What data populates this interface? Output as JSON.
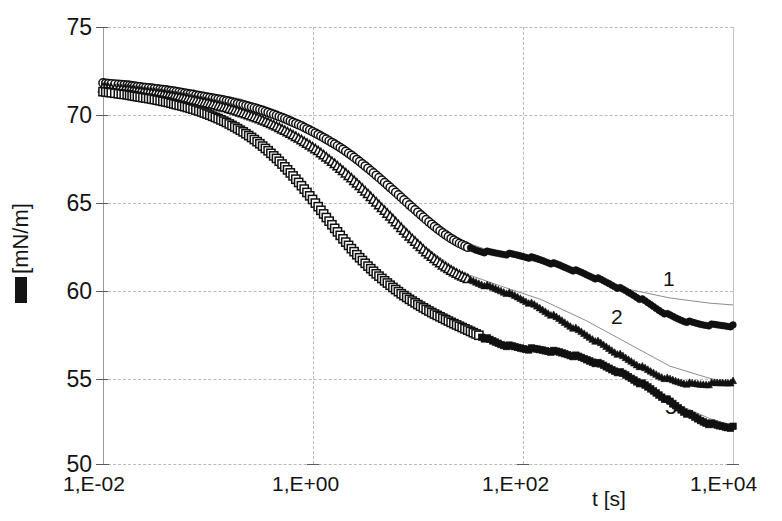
{
  "chart_data": {
    "type": "scatter",
    "title": "",
    "xlabel": "t [s]",
    "ylabel": "[mN/m]",
    "ylabel_symbol": "filled-square-glyph",
    "xscale": "log",
    "xlim": [
      0.01,
      10000
    ],
    "ylim": [
      50,
      75
    ],
    "yticks": [
      50,
      55,
      60,
      65,
      70,
      75
    ],
    "ytick_labels": [
      "50",
      "55",
      "60",
      "65",
      "70",
      "75"
    ],
    "xticks": [
      0.01,
      1,
      100,
      10000
    ],
    "xtick_labels": [
      "1,E-02",
      "1,E+00",
      "1,E+02",
      "1,E+04"
    ],
    "grid": true,
    "legend": "inline-curve-numbers",
    "annotations": [
      {
        "text": "1",
        "x": 2000,
        "y": 61.0
      },
      {
        "text": "2",
        "x": 260,
        "y": 59.6
      },
      {
        "text": "3",
        "x": 700,
        "y": 54.0
      }
    ],
    "series": [
      {
        "name": "1",
        "label": "1",
        "marker_open": "circle",
        "marker_filled": "filled-circle",
        "open_range": [
          0.01,
          30
        ],
        "filled_range": [
          30,
          10000
        ],
        "points": [
          [
            0.01,
            71.8
          ],
          [
            0.012,
            71.75
          ],
          [
            0.014,
            71.72
          ],
          [
            0.017,
            71.68
          ],
          [
            0.02,
            71.62
          ],
          [
            0.024,
            71.55
          ],
          [
            0.029,
            71.5
          ],
          [
            0.035,
            71.44
          ],
          [
            0.042,
            71.38
          ],
          [
            0.05,
            71.3
          ],
          [
            0.06,
            71.22
          ],
          [
            0.072,
            71.14
          ],
          [
            0.087,
            71.05
          ],
          [
            0.104,
            70.96
          ],
          [
            0.125,
            70.88
          ],
          [
            0.15,
            70.78
          ],
          [
            0.18,
            70.66
          ],
          [
            0.216,
            70.55
          ],
          [
            0.26,
            70.42
          ],
          [
            0.312,
            70.28
          ],
          [
            0.374,
            70.12
          ],
          [
            0.449,
            69.94
          ],
          [
            0.539,
            69.76
          ],
          [
            0.646,
            69.55
          ],
          [
            0.776,
            69.34
          ],
          [
            0.931,
            69.1
          ],
          [
            1.12,
            68.85
          ],
          [
            1.34,
            68.58
          ],
          [
            1.61,
            68.3
          ],
          [
            1.93,
            68.0
          ],
          [
            2.32,
            67.66
          ],
          [
            2.78,
            67.3
          ],
          [
            3.34,
            66.92
          ],
          [
            4.0,
            66.52
          ],
          [
            4.81,
            66.1
          ],
          [
            5.77,
            65.68
          ],
          [
            6.92,
            65.25
          ],
          [
            8.3,
            64.82
          ],
          [
            9.97,
            64.4
          ],
          [
            11.96,
            63.98
          ],
          [
            14.36,
            63.58
          ],
          [
            17.23,
            63.22
          ],
          [
            20.68,
            62.9
          ],
          [
            24.81,
            62.62
          ],
          [
            29.77,
            62.4
          ],
          [
            35.73,
            62.24
          ],
          [
            42.87,
            62.14
          ],
          [
            51.45,
            62.08
          ],
          [
            61.74,
            62.04
          ],
          [
            74.08,
            62.0
          ],
          [
            88.9,
            61.94
          ],
          [
            106.7,
            61.86
          ],
          [
            128.0,
            61.76
          ],
          [
            153.6,
            61.64
          ],
          [
            184.3,
            61.5
          ],
          [
            221.2,
            61.36
          ],
          [
            265.4,
            61.2
          ],
          [
            318.5,
            61.04
          ],
          [
            382.2,
            60.88
          ],
          [
            458.6,
            60.7
          ],
          [
            550.3,
            60.52
          ],
          [
            660.4,
            60.32
          ],
          [
            792.5,
            60.1
          ],
          [
            951.0,
            59.88
          ],
          [
            1141,
            59.64
          ],
          [
            1369,
            59.38
          ],
          [
            1643,
            59.1
          ],
          [
            1972,
            58.82
          ],
          [
            2366,
            58.56
          ],
          [
            2839,
            58.36
          ],
          [
            3407,
            58.2
          ],
          [
            4089,
            58.08
          ],
          [
            4907,
            58.0
          ],
          [
            5888,
            57.96
          ],
          [
            7066,
            57.94
          ],
          [
            8479,
            57.92
          ],
          [
            10000,
            57.9
          ]
        ]
      },
      {
        "name": "2",
        "label": "2",
        "marker_open": "triangle",
        "marker_filled": "filled-triangle",
        "open_range": [
          0.01,
          30
        ],
        "filled_range": [
          30,
          10000
        ],
        "points": [
          [
            0.01,
            71.5
          ],
          [
            0.012,
            71.46
          ],
          [
            0.014,
            71.42
          ],
          [
            0.017,
            71.38
          ],
          [
            0.02,
            71.32
          ],
          [
            0.024,
            71.26
          ],
          [
            0.029,
            71.2
          ],
          [
            0.035,
            71.14
          ],
          [
            0.042,
            71.06
          ],
          [
            0.05,
            70.98
          ],
          [
            0.06,
            70.9
          ],
          [
            0.072,
            70.8
          ],
          [
            0.087,
            70.7
          ],
          [
            0.104,
            70.6
          ],
          [
            0.125,
            70.48
          ],
          [
            0.15,
            70.36
          ],
          [
            0.18,
            70.22
          ],
          [
            0.216,
            70.06
          ],
          [
            0.26,
            69.9
          ],
          [
            0.312,
            69.72
          ],
          [
            0.374,
            69.52
          ],
          [
            0.449,
            69.3
          ],
          [
            0.539,
            69.06
          ],
          [
            0.646,
            68.8
          ],
          [
            0.776,
            68.52
          ],
          [
            0.931,
            68.22
          ],
          [
            1.12,
            67.9
          ],
          [
            1.34,
            67.54
          ],
          [
            1.61,
            67.16
          ],
          [
            1.93,
            66.76
          ],
          [
            2.32,
            66.34
          ],
          [
            2.78,
            65.9
          ],
          [
            3.34,
            65.44
          ],
          [
            4.0,
            64.96
          ],
          [
            4.81,
            64.48
          ],
          [
            5.77,
            64.0
          ],
          [
            6.92,
            63.5
          ],
          [
            8.3,
            63.02
          ],
          [
            9.97,
            62.56
          ],
          [
            11.96,
            62.12
          ],
          [
            14.36,
            61.72
          ],
          [
            17.23,
            61.36
          ],
          [
            20.68,
            61.06
          ],
          [
            24.81,
            60.8
          ],
          [
            29.77,
            60.58
          ],
          [
            35.73,
            60.4
          ],
          [
            42.87,
            60.24
          ],
          [
            51.45,
            60.08
          ],
          [
            61.74,
            59.92
          ],
          [
            74.08,
            59.74
          ],
          [
            88.9,
            59.54
          ],
          [
            106.7,
            59.32
          ],
          [
            128.0,
            59.08
          ],
          [
            153.6,
            58.82
          ],
          [
            184.3,
            58.56
          ],
          [
            221.2,
            58.28
          ],
          [
            265.4,
            58.0
          ],
          [
            318.5,
            57.72
          ],
          [
            382.2,
            57.44
          ],
          [
            458.6,
            57.16
          ],
          [
            550.3,
            56.88
          ],
          [
            660.4,
            56.6
          ],
          [
            792.5,
            56.32
          ],
          [
            951.0,
            56.04
          ],
          [
            1141,
            55.78
          ],
          [
            1369,
            55.52
          ],
          [
            1643,
            55.28
          ],
          [
            1972,
            55.06
          ],
          [
            2366,
            54.88
          ],
          [
            2839,
            54.74
          ],
          [
            3407,
            54.64
          ],
          [
            4089,
            54.58
          ],
          [
            4907,
            54.56
          ],
          [
            5888,
            54.58
          ],
          [
            7066,
            54.62
          ],
          [
            8479,
            54.66
          ],
          [
            10000,
            54.7
          ]
        ]
      },
      {
        "name": "3",
        "label": "3",
        "marker_open": "square",
        "marker_filled": "filled-square",
        "open_range": [
          0.01,
          40
        ],
        "filled_range": [
          40,
          10000
        ],
        "points": [
          [
            0.01,
            71.3
          ],
          [
            0.012,
            71.24
          ],
          [
            0.014,
            71.18
          ],
          [
            0.017,
            71.12
          ],
          [
            0.02,
            71.04
          ],
          [
            0.024,
            70.96
          ],
          [
            0.029,
            70.88
          ],
          [
            0.035,
            70.78
          ],
          [
            0.042,
            70.68
          ],
          [
            0.05,
            70.56
          ],
          [
            0.06,
            70.44
          ],
          [
            0.072,
            70.3
          ],
          [
            0.087,
            70.14
          ],
          [
            0.104,
            69.96
          ],
          [
            0.125,
            69.76
          ],
          [
            0.15,
            69.54
          ],
          [
            0.18,
            69.28
          ],
          [
            0.216,
            69.0
          ],
          [
            0.26,
            68.68
          ],
          [
            0.312,
            68.32
          ],
          [
            0.374,
            67.92
          ],
          [
            0.449,
            67.48
          ],
          [
            0.539,
            67.0
          ],
          [
            0.646,
            66.48
          ],
          [
            0.776,
            65.92
          ],
          [
            0.931,
            65.34
          ],
          [
            1.12,
            64.72
          ],
          [
            1.34,
            64.1
          ],
          [
            1.61,
            63.48
          ],
          [
            1.93,
            62.88
          ],
          [
            2.32,
            62.32
          ],
          [
            2.78,
            61.8
          ],
          [
            3.34,
            61.32
          ],
          [
            4.0,
            60.88
          ],
          [
            4.81,
            60.48
          ],
          [
            5.77,
            60.1
          ],
          [
            6.92,
            59.74
          ],
          [
            8.3,
            59.42
          ],
          [
            9.97,
            59.12
          ],
          [
            11.96,
            58.84
          ],
          [
            14.36,
            58.58
          ],
          [
            17.23,
            58.34
          ],
          [
            20.68,
            58.1
          ],
          [
            24.81,
            57.88
          ],
          [
            29.77,
            57.66
          ],
          [
            35.73,
            57.44
          ],
          [
            42.87,
            57.22
          ],
          [
            51.45,
            57.02
          ],
          [
            61.74,
            56.86
          ],
          [
            74.08,
            56.74
          ],
          [
            88.9,
            56.66
          ],
          [
            106.7,
            56.6
          ],
          [
            128.0,
            56.56
          ],
          [
            153.6,
            56.52
          ],
          [
            184.3,
            56.46
          ],
          [
            221.2,
            56.38
          ],
          [
            265.4,
            56.28
          ],
          [
            318.5,
            56.16
          ],
          [
            382.2,
            56.02
          ],
          [
            458.6,
            55.86
          ],
          [
            550.3,
            55.68
          ],
          [
            660.4,
            55.48
          ],
          [
            792.5,
            55.28
          ],
          [
            951.0,
            55.06
          ],
          [
            1141,
            54.82
          ],
          [
            1369,
            54.56
          ],
          [
            1643,
            54.28
          ],
          [
            1972,
            53.98
          ],
          [
            2366,
            53.66
          ],
          [
            2839,
            53.34
          ],
          [
            3407,
            53.02
          ],
          [
            4089,
            52.74
          ],
          [
            4907,
            52.5
          ],
          [
            5888,
            52.32
          ],
          [
            7066,
            52.2
          ],
          [
            8479,
            52.14
          ],
          [
            10000,
            52.1
          ]
        ]
      }
    ],
    "fit_curves": [
      {
        "for_series": "1",
        "points": [
          [
            0.01,
            71.9
          ],
          [
            0.05,
            71.5
          ],
          [
            0.2,
            70.9
          ],
          [
            0.6,
            69.9
          ],
          [
            1.5,
            68.6
          ],
          [
            4,
            66.7
          ],
          [
            10,
            64.6
          ],
          [
            25,
            62.8
          ],
          [
            60,
            62.0
          ],
          [
            150,
            61.5
          ],
          [
            400,
            60.8
          ],
          [
            1000,
            60.0
          ],
          [
            2500,
            59.5
          ],
          [
            6000,
            59.2
          ],
          [
            10000,
            59.1
          ]
        ]
      },
      {
        "for_series": "2",
        "points": [
          [
            0.01,
            71.6
          ],
          [
            0.05,
            71.1
          ],
          [
            0.2,
            70.4
          ],
          [
            0.6,
            69.0
          ],
          [
            1.5,
            67.3
          ],
          [
            4,
            65.0
          ],
          [
            10,
            62.7
          ],
          [
            25,
            61.0
          ],
          [
            60,
            60.2
          ],
          [
            150,
            59.4
          ],
          [
            400,
            58.2
          ],
          [
            1000,
            56.9
          ],
          [
            2500,
            55.6
          ],
          [
            6000,
            54.9
          ],
          [
            10000,
            54.6
          ]
        ]
      },
      {
        "for_series": "3",
        "points": [
          [
            0.01,
            71.4
          ],
          [
            0.05,
            70.7
          ],
          [
            0.2,
            69.4
          ],
          [
            0.6,
            66.9
          ],
          [
            1.5,
            64.0
          ],
          [
            4,
            61.0
          ],
          [
            10,
            59.1
          ],
          [
            25,
            57.9
          ],
          [
            60,
            56.9
          ],
          [
            150,
            56.6
          ],
          [
            400,
            56.0
          ],
          [
            1000,
            55.0
          ],
          [
            2500,
            53.6
          ],
          [
            6000,
            52.6
          ],
          [
            10000,
            52.2
          ]
        ]
      }
    ]
  },
  "axis": {
    "y_label_text": "[mN/m]",
    "x_axis_title": "t [s]"
  }
}
